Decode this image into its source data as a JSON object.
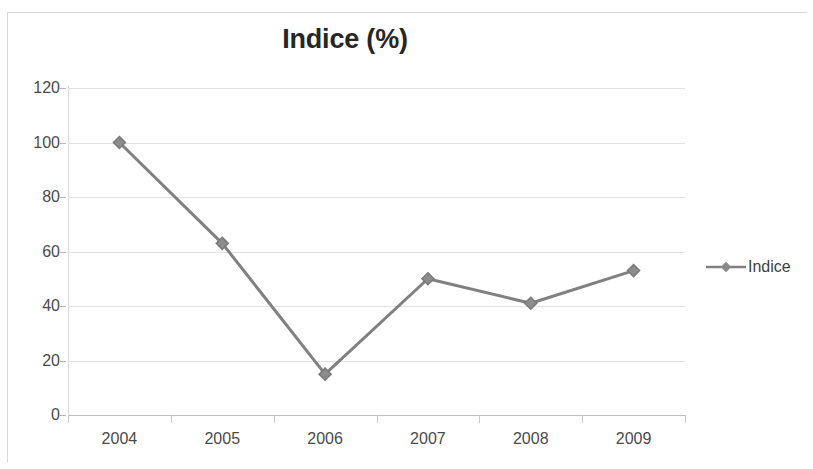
{
  "chart_data": {
    "type": "line",
    "title": "Indice (%)",
    "xlabel": "",
    "ylabel": "",
    "categories": [
      "2004",
      "2005",
      "2006",
      "2007",
      "2008",
      "2009"
    ],
    "x": [
      2004,
      2005,
      2006,
      2007,
      2008,
      2009
    ],
    "series": [
      {
        "name": "Indice",
        "values": [
          100,
          63,
          15,
          50,
          41,
          53
        ],
        "color": "#808080",
        "marker": "diamond"
      }
    ],
    "ylim": [
      0,
      120
    ],
    "ytick_labels": [
      "0",
      "20",
      "40",
      "60",
      "80",
      "100",
      "120"
    ],
    "ytick_values": [
      0,
      20,
      40,
      60,
      80,
      100,
      120
    ],
    "grid": true,
    "legend": {
      "position": "right",
      "entries": [
        "Indice"
      ]
    }
  },
  "legend": {
    "entry_label": "Indice",
    "marker_name": "diamond-marker"
  },
  "colors": {
    "series": "#808080",
    "gridline": "#e2e2e2",
    "axis": "#bdbdbd",
    "title_text": "#262626",
    "tick_text": "#4a4a4a",
    "background": "#ffffff",
    "frame": "#d8d8d8"
  }
}
